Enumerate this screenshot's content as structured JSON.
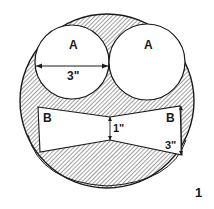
{
  "diagram": {
    "figure_number": "1",
    "colors": {
      "ink": "#1a1a1a",
      "hatch": "#2a2a2a",
      "background": "#ffffff"
    },
    "circles_a": [
      {
        "label": "A",
        "dimension": "3\""
      },
      {
        "label": "A"
      }
    ],
    "bowtie_b": {
      "left_label": "B",
      "right_label": "B",
      "center_dimension": "1\"",
      "edge_dimension": "3\""
    }
  }
}
